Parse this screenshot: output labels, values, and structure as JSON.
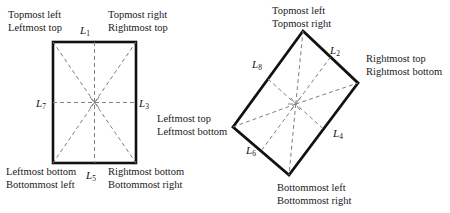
{
  "figure": {
    "type": "diagram",
    "stroke_color": "#111111",
    "dashed_color": "#777777",
    "background": "#ffffff"
  },
  "left_shape": {
    "name": "axis-aligned-rectangle",
    "corners": [
      [
        53,
        42
      ],
      [
        136,
        42
      ],
      [
        136,
        163
      ],
      [
        53,
        163
      ]
    ],
    "center": [
      94.5,
      102.5
    ],
    "edge_labels": [
      {
        "id": "L1",
        "base": "L",
        "sub": "1",
        "position": "top"
      },
      {
        "id": "L3",
        "base": "L",
        "sub": "3",
        "position": "right"
      },
      {
        "id": "L5",
        "base": "L",
        "sub": "5",
        "position": "bottom"
      },
      {
        "id": "L7",
        "base": "L",
        "sub": "7",
        "position": "left"
      }
    ],
    "annotations": [
      {
        "name": "top-left-annotation",
        "line1": "Topmost left",
        "line2": "Leftmost top"
      },
      {
        "name": "top-right-annotation",
        "line1": "Topmost right",
        "line2": "Rightmost top"
      },
      {
        "name": "bottom-left-annotation",
        "line1": "Leftmost bottom",
        "line2": "Bottommost left"
      },
      {
        "name": "bottom-right-annotation",
        "line1": "Rightmost bottom",
        "line2": "Bottommost right"
      }
    ]
  },
  "right_shape": {
    "name": "rotated-rectangle",
    "corners": [
      [
        303,
        31
      ],
      [
        358,
        83
      ],
      [
        289,
        175
      ],
      [
        233,
        127
      ]
    ],
    "center": [
      295.75,
      104
    ],
    "edge_labels": [
      {
        "id": "L2",
        "base": "L",
        "sub": "2",
        "position": "upper-right"
      },
      {
        "id": "L4",
        "base": "L",
        "sub": "4",
        "position": "lower-right"
      },
      {
        "id": "L6",
        "base": "L",
        "sub": "6",
        "position": "lower-left"
      },
      {
        "id": "L8",
        "base": "L",
        "sub": "8",
        "position": "upper-left"
      }
    ],
    "annotations": [
      {
        "name": "top-annotation",
        "line1": "Topmost left",
        "line2": "Topmost right"
      },
      {
        "name": "right-annotation",
        "line1": "Rightmost top",
        "line2": "Rightmost bottom"
      },
      {
        "name": "left-annotation",
        "line1": "Leftmost top",
        "line2": "Leftmost bottom"
      },
      {
        "name": "bottom-annotation",
        "line1": "Bottommost left",
        "line2": "Bottommost right"
      }
    ]
  }
}
